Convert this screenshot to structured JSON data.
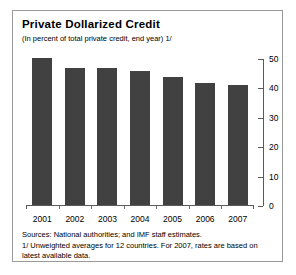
{
  "chart_data": {
    "type": "bar",
    "title": "Private Dollarized Credit",
    "subtitle": "(In percent of total private credit, end year) 1/",
    "categories": [
      "2001",
      "2002",
      "2003",
      "2004",
      "2005",
      "2006",
      "2007"
    ],
    "values": [
      47,
      44,
      44,
      43,
      41,
      39,
      38.5
    ],
    "xlabel": "",
    "ylabel": "",
    "ylim": [
      0,
      50
    ],
    "yticks": [
      0,
      10,
      20,
      30,
      40,
      50
    ],
    "ytick_labels": [
      "0",
      "10",
      "20",
      "30",
      "40",
      "50"
    ],
    "axis_position": "right",
    "grid": false,
    "legend": false,
    "bar_color": "#414141",
    "series": [
      {
        "name": "Private dollarized credit",
        "values": [
          47,
          44,
          44,
          43,
          41,
          39,
          38.5
        ]
      }
    ]
  },
  "footnotes": {
    "sources": "Sources: National authorities; and IMF staff estimates.",
    "note": "1/ Unweighted averages for 12 countries. For 2007, rates are based on latest available data."
  }
}
